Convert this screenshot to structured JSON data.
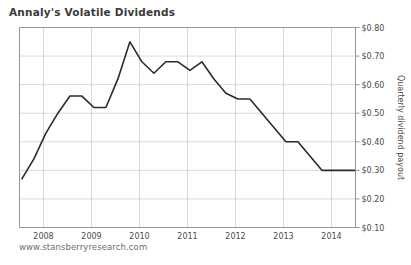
{
  "chart_data": {
    "type": "line",
    "title": "Annaly's Volatile Dividends",
    "xlabel": "",
    "ylabel": "Quarterly dividend payout",
    "source": "www.stansberryresearch.com",
    "grid": true,
    "legend": "none",
    "xlim": [
      2007.5,
      2014.5
    ],
    "ylim": [
      0.1,
      0.8
    ],
    "ytick_labels": [
      "$0.80",
      "$0.70",
      "$0.60",
      "$0.50",
      "$0.40",
      "$0.30",
      "$0.20",
      "$0.10"
    ],
    "ytick_values": [
      0.8,
      0.7,
      0.6,
      0.5,
      0.4,
      0.3,
      0.2,
      0.1
    ],
    "xtick_labels": [
      "2008",
      "2009",
      "2010",
      "2011",
      "2012",
      "2013",
      "2014"
    ],
    "xtick_values": [
      2008,
      2009,
      2010,
      2011,
      2012,
      2013,
      2014
    ],
    "series": [
      {
        "name": "Quarterly dividend payout",
        "color": "#2b2b2b",
        "x": [
          2007.55,
          2007.8,
          2008.05,
          2008.3,
          2008.55,
          2008.8,
          2009.05,
          2009.3,
          2009.55,
          2009.8,
          2010.05,
          2010.3,
          2010.55,
          2010.8,
          2011.05,
          2011.3,
          2011.55,
          2011.8,
          2012.05,
          2012.3,
          2012.55,
          2012.8,
          2013.05,
          2013.3,
          2013.55,
          2013.8,
          2014.05,
          2014.3,
          2014.48
        ],
        "y": [
          0.27,
          0.34,
          0.43,
          0.5,
          0.56,
          0.56,
          0.52,
          0.52,
          0.62,
          0.75,
          0.68,
          0.64,
          0.68,
          0.68,
          0.65,
          0.68,
          0.62,
          0.57,
          0.55,
          0.55,
          0.5,
          0.45,
          0.4,
          0.4,
          0.35,
          0.3,
          0.3,
          0.3,
          0.3
        ]
      }
    ]
  }
}
